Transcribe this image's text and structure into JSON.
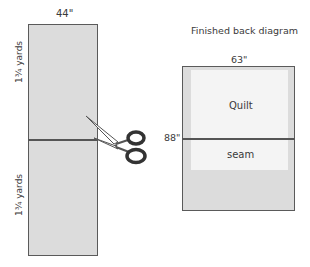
{
  "left_diagram": {
    "width_label": "44\"",
    "top_panel_label": "1¾ yards",
    "bottom_panel_label": "1¾ yards",
    "icon": "scissors-icon"
  },
  "right_diagram": {
    "title": "Finished back diagram",
    "width_label": "63\"",
    "height_label": "88\"",
    "quilt_label": "Quilt",
    "seam_label": "seam"
  },
  "colors": {
    "fabric": "#dcdcdc",
    "quilt": "#f4f4f4",
    "outline": "#5a5a5a"
  }
}
